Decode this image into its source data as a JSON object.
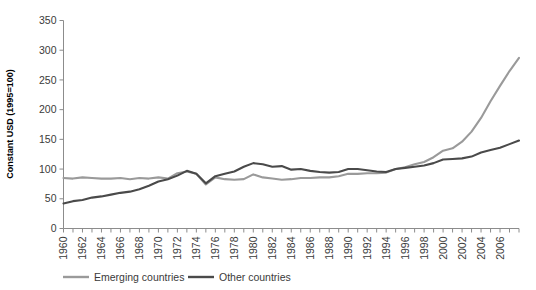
{
  "title_partial": "",
  "axis": {
    "ylabel": "Constant USD (1995=100)",
    "xlabel": "",
    "yticks": [
      "0",
      "50",
      "100",
      "150",
      "200",
      "250",
      "300",
      "350"
    ],
    "xticks": [
      "1960",
      "1962",
      "1964",
      "1966",
      "1968",
      "1970",
      "1972",
      "1974",
      "1976",
      "1978",
      "1980",
      "1982",
      "1984",
      "1986",
      "1988",
      "1990",
      "1992",
      "1994",
      "1996",
      "1998",
      "2000",
      "2002",
      "2004",
      "2006"
    ]
  },
  "legend": {
    "position": "bottom-left",
    "items": [
      {
        "label": "Emerging countries",
        "color": "#9a9a9a",
        "swatch": "line-swatch"
      },
      {
        "label": "Other countries",
        "color": "#4a4a4a",
        "swatch": "line-swatch"
      }
    ]
  },
  "colors": {
    "emerging": "#9a9a9a",
    "other": "#4a4a4a",
    "axis": "#8c8c8c",
    "tick_text": "#3a3a3a",
    "background": "#ffffff"
  },
  "chart_data": {
    "type": "line",
    "title": "",
    "xlabel": "",
    "ylabel": "Constant USD (1995=100)",
    "xlim": [
      1960,
      2008
    ],
    "ylim": [
      0,
      350
    ],
    "grid": false,
    "legend_position": "bottom-left",
    "x": [
      1960,
      1961,
      1962,
      1963,
      1964,
      1965,
      1966,
      1967,
      1968,
      1969,
      1970,
      1971,
      1972,
      1973,
      1974,
      1975,
      1976,
      1977,
      1978,
      1979,
      1980,
      1981,
      1982,
      1983,
      1984,
      1985,
      1986,
      1987,
      1988,
      1989,
      1990,
      1991,
      1992,
      1993,
      1994,
      1995,
      1996,
      1997,
      1998,
      1999,
      2000,
      2001,
      2002,
      2003,
      2004,
      2005,
      2006,
      2007,
      2008
    ],
    "series": [
      {
        "name": "Emerging countries",
        "color": "#9a9a9a",
        "values": [
          85,
          84,
          86,
          85,
          84,
          84,
          85,
          83,
          85,
          84,
          86,
          84,
          93,
          96,
          92,
          74,
          86,
          83,
          82,
          83,
          91,
          86,
          84,
          82,
          83,
          85,
          85,
          86,
          86,
          88,
          92,
          92,
          93,
          93,
          94,
          100,
          103,
          108,
          112,
          120,
          131,
          135,
          146,
          163,
          186,
          214,
          240,
          265,
          287
        ]
      },
      {
        "name": "Other countries",
        "color": "#4a4a4a",
        "values": [
          42,
          46,
          48,
          52,
          54,
          57,
          60,
          62,
          66,
          72,
          79,
          83,
          89,
          97,
          92,
          76,
          88,
          92,
          96,
          104,
          110,
          108,
          104,
          105,
          99,
          100,
          97,
          95,
          94,
          95,
          100,
          100,
          98,
          96,
          95,
          100,
          102,
          104,
          106,
          110,
          116,
          117,
          118,
          121,
          128,
          132,
          136,
          142,
          148
        ]
      }
    ]
  }
}
